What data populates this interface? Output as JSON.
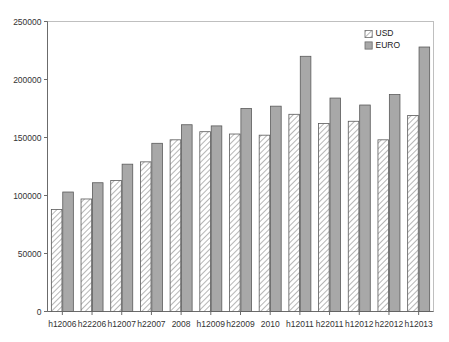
{
  "chart_data": {
    "type": "bar",
    "title": "",
    "subtitle": "",
    "xlabel": "",
    "ylabel": "",
    "grid": false,
    "legend_position": "top-right",
    "ylim": [
      0,
      250000
    ],
    "yticks": [
      0,
      50000,
      100000,
      150000,
      200000,
      250000
    ],
    "ytick_labels": [
      "0",
      "50000",
      "100000",
      "150000",
      "200000",
      "250000"
    ],
    "categories": [
      "h12006",
      "h22206",
      "h12007",
      "h22007",
      "2008",
      "h12009",
      "h22009",
      "2010",
      "h12011",
      "h22011",
      "h12012",
      "h22012",
      "h12013"
    ],
    "series": [
      {
        "name": "USD",
        "fill": "#ffffff",
        "pattern": "diagonal-hatch",
        "values": [
          88000,
          97000,
          113000,
          129000,
          148000,
          155000,
          153000,
          152000,
          170000,
          162000,
          164000,
          148000,
          169000
        ]
      },
      {
        "name": "EURO",
        "fill": "#a8a8a8",
        "pattern": "solid",
        "values": [
          103000,
          111000,
          127000,
          145000,
          161000,
          160000,
          175000,
          177000,
          220000,
          184000,
          178000,
          187000,
          228000
        ]
      }
    ]
  },
  "legend": {
    "entries": [
      {
        "label": "USD"
      },
      {
        "label": "EURO"
      }
    ]
  },
  "colors": {
    "usd_fill": "#ffffff",
    "euro_fill": "#a8a8a8",
    "bar_outline": "#5a5a5a",
    "frame": "#bfbfbf",
    "axis": "#6b6b6b",
    "text": "#333333"
  }
}
